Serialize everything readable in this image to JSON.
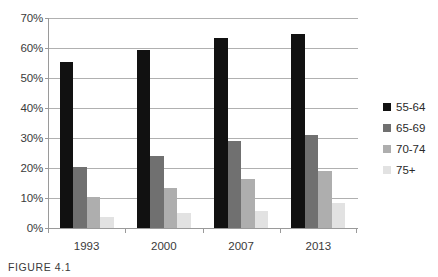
{
  "caption": "FIGURE 4.1",
  "legend": {
    "position": "right",
    "entries": [
      {
        "label": "55-64",
        "color": "#111111"
      },
      {
        "label": "65-69",
        "color": "#707070"
      },
      {
        "label": "70-74",
        "color": "#aeaeae"
      },
      {
        "label": "75+",
        "color": "#e2e2e2"
      }
    ]
  },
  "axis": {
    "y_ticks": [
      "0%",
      "10%",
      "20%",
      "30%",
      "40%",
      "50%",
      "60%",
      "70%"
    ],
    "x_ticks": [
      "1993",
      "2000",
      "2007",
      "2013"
    ]
  },
  "chart_data": {
    "type": "bar",
    "title": "",
    "xlabel": "",
    "ylabel": "",
    "ylim": [
      0,
      70
    ],
    "ytick_values": [
      0,
      10,
      20,
      30,
      40,
      50,
      60,
      70
    ],
    "ytick_labels": [
      "0%",
      "10%",
      "20%",
      "30%",
      "40%",
      "50%",
      "60%",
      "70%"
    ],
    "grid": true,
    "legend_position": "right",
    "categories": [
      "1993",
      "2000",
      "2007",
      "2013"
    ],
    "series": [
      {
        "name": "55-64",
        "color": "#111111",
        "values": [
          55.5,
          59.2,
          63.3,
          64.8
        ]
      },
      {
        "name": "65-69",
        "color": "#707070",
        "values": [
          20.2,
          24.0,
          29.1,
          31.0
        ]
      },
      {
        "name": "70-74",
        "color": "#aeaeae",
        "values": [
          10.5,
          13.4,
          16.5,
          19.0
        ]
      },
      {
        "name": "75+",
        "color": "#e2e2e2",
        "values": [
          3.6,
          4.9,
          5.6,
          8.5
        ]
      }
    ]
  }
}
